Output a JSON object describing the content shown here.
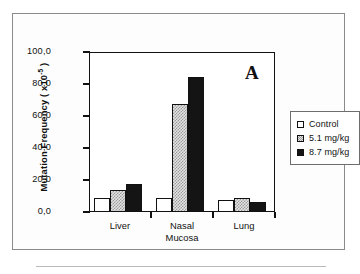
{
  "figure": {
    "panel_letter": "A"
  },
  "chart_data": {
    "type": "bar",
    "title": "",
    "panel_label": "A",
    "categories": [
      "Liver",
      "Nasal Mucosa",
      "Lung"
    ],
    "category_lines": [
      [
        "Liver"
      ],
      [
        "Nasal",
        "Mucosa"
      ],
      [
        "Lung"
      ]
    ],
    "series": [
      {
        "name": "Control",
        "values": [
          8.5,
          8.5,
          7.5
        ],
        "color": "#ffffff",
        "pattern": "empty"
      },
      {
        "name": "5.1 mg/kg",
        "values": [
          13.5,
          67.5,
          9.0
        ],
        "color": "#e3e3e3",
        "pattern": "checkered"
      },
      {
        "name": "8.7 mg/kg",
        "values": [
          17.5,
          84.5,
          6.5
        ],
        "color": "#141414",
        "pattern": "solid"
      }
    ],
    "xlabel": "",
    "ylabel": "Mutation Frequency ( x10 -5 )",
    "ylabel_prefix": "Mutation Frequency ( x10",
    "ylabel_exponent": "-5",
    "ylabel_suffix": " )",
    "ylim": [
      0,
      100
    ],
    "ytick_values": [
      0,
      20,
      40,
      60,
      80,
      100
    ],
    "ytick_labels": [
      "0,0",
      "20,0",
      "40,0",
      "60,0",
      "80,0",
      "100,0"
    ],
    "grid": false,
    "legend_position": "right-outside",
    "legend_entries": [
      "Control",
      "5.1 mg/kg",
      "8.7 mg/kg"
    ]
  }
}
